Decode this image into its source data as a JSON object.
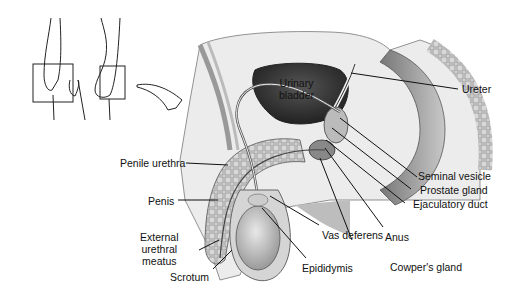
{
  "diagram": {
    "type": "anatomical-illustration",
    "inset": {
      "description": "Orientation sketch of legs with a section plane and curved arrow pointing to the main view"
    },
    "labels": {
      "urinary_bladder": "Urinary bladder",
      "ureter": "Ureter",
      "seminal_vesicle": "Seminal vesicle",
      "prostate_gland": "Prostate gland",
      "ejaculatory_duct": "Ejaculatory duct",
      "anus": "Anus",
      "cowpers_gland": "Cowper's gland",
      "epididymis": "Epididymis",
      "vas_deferens": "Vas deferens",
      "scrotum": "Scrotum",
      "external_urethral_meatus": "External urethral meatus",
      "penis": "Penis",
      "penile_urethra": "Penile urethra"
    },
    "label_lines": {
      "bladder_1": "Urinary",
      "bladder_2": "bladder",
      "meatus_1": "External",
      "meatus_2": "urethral",
      "meatus_3": "meatus"
    },
    "colors": {
      "ink": "#111111",
      "shade_dark": "#3a3a3a",
      "shade_mid": "#8a8a8a",
      "shade_light": "#d0d0d0",
      "background": "#ffffff"
    }
  }
}
